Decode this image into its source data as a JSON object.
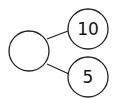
{
  "diagram": {
    "type": "number-bond",
    "whole": {
      "label": ""
    },
    "parts": [
      {
        "label": "10"
      },
      {
        "label": "5"
      }
    ],
    "colors": {
      "stroke": "#222222",
      "background": "#ffffff"
    }
  }
}
